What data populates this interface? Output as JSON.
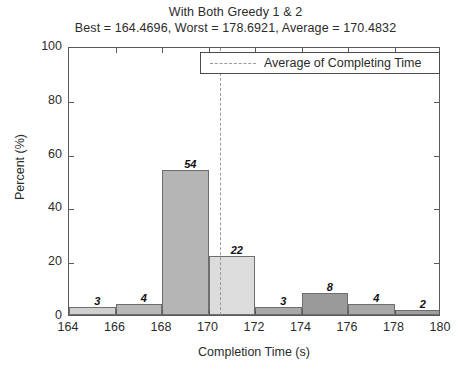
{
  "chart_data": {
    "type": "bar",
    "title": "With Both Greedy 1 & 2",
    "subtitle": "Best = 164.4696, Worst = 178.6921, Average = 170.4832",
    "xlabel": "Completion Time (s)",
    "ylabel": "Percent (%)",
    "xlim": [
      164,
      180
    ],
    "ylim": [
      0,
      100
    ],
    "grid": false,
    "bin_width": 2,
    "categories": [
      "164-166",
      "166-168",
      "168-170",
      "170-172",
      "172-174",
      "174-176",
      "176-178",
      "178-180"
    ],
    "bin_starts": [
      164,
      166,
      168,
      170,
      172,
      174,
      176,
      178
    ],
    "values": [
      3,
      4,
      54,
      22,
      3,
      8,
      4,
      2
    ],
    "bar_colors": [
      "#cfcfcf",
      "#b8b8b8",
      "#b5b5b5",
      "#dcdcdc",
      "#a8a8a8",
      "#9a9a9a",
      "#a8a8a8",
      "#9f9f9f"
    ],
    "xticks": [
      164,
      166,
      168,
      170,
      172,
      174,
      176,
      178,
      180
    ],
    "xtick_labels": [
      "164",
      "166",
      "168",
      "170",
      "172",
      "174",
      "176",
      "178",
      "180"
    ],
    "yticks": [
      0,
      20,
      40,
      60,
      80,
      100
    ],
    "ytick_labels": [
      "0",
      "20",
      "40",
      "60",
      "80",
      "100"
    ],
    "annotations": {
      "average_line_value": 170.4832,
      "average_line_style": "dashed",
      "average_line_color": "#9a9a9a"
    },
    "legend": {
      "position": "top-right",
      "entries": [
        {
          "label": "Average of Completing Time",
          "style": "dashed-line",
          "color": "#9a9a9a"
        }
      ]
    },
    "stats": {
      "best": 164.4696,
      "worst": 178.6921,
      "average": 170.4832
    }
  }
}
